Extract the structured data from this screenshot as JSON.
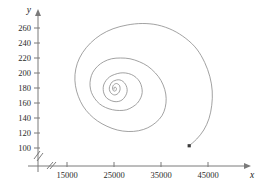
{
  "chart_data": {
    "type": "line",
    "title": "",
    "xlabel": "x",
    "ylabel": "y",
    "grid": false,
    "legend": null,
    "axis_break_x": true,
    "axis_break_y": true,
    "xlim": [
      10000,
      48000
    ],
    "ylim": [
      90,
      272
    ],
    "xticks": [
      15000,
      25000,
      35000,
      45000
    ],
    "xticklabels": [
      "15000",
      "25000",
      "35000",
      "45000"
    ],
    "yticks": [
      100,
      120,
      140,
      160,
      180,
      200,
      220,
      240,
      260
    ],
    "yticklabels": [
      "100",
      "120",
      "140",
      "160",
      "180",
      "200",
      "220",
      "240",
      "260"
    ],
    "equilibrium": {
      "x": 25000,
      "y": 178
    },
    "start_point": {
      "x": 41000,
      "y": 103
    },
    "series": [
      {
        "name": "trajectory",
        "color": "#8a8a8a",
        "marker_at_start": true,
        "points": [
          [
            41000,
            103
          ],
          [
            42600,
            112
          ],
          [
            44100,
            124
          ],
          [
            45200,
            139
          ],
          [
            45800,
            157
          ],
          [
            45900,
            176
          ],
          [
            45400,
            195
          ],
          [
            44300,
            214
          ],
          [
            42600,
            232
          ],
          [
            40300,
            246
          ],
          [
            37500,
            257
          ],
          [
            34300,
            264
          ],
          [
            31000,
            266
          ],
          [
            27800,
            264
          ],
          [
            24800,
            259
          ],
          [
            22200,
            251
          ],
          [
            20000,
            240
          ],
          [
            18300,
            227
          ],
          [
            17200,
            213
          ],
          [
            16700,
            198
          ],
          [
            16800,
            183
          ],
          [
            17400,
            169
          ],
          [
            18400,
            156
          ],
          [
            19800,
            145
          ],
          [
            21500,
            136
          ],
          [
            23500,
            129
          ],
          [
            25700,
            124
          ],
          [
            28000,
            122
          ],
          [
            30200,
            123
          ],
          [
            32200,
            127
          ],
          [
            33900,
            134
          ],
          [
            35200,
            143
          ],
          [
            35900,
            154
          ],
          [
            36100,
            166
          ],
          [
            35800,
            178
          ],
          [
            35000,
            190
          ],
          [
            33800,
            200
          ],
          [
            32200,
            209
          ],
          [
            30400,
            215
          ],
          [
            28400,
            219
          ],
          [
            26400,
            220
          ],
          [
            24500,
            219
          ],
          [
            22800,
            215
          ],
          [
            21500,
            209
          ],
          [
            20500,
            201
          ],
          [
            20000,
            192
          ],
          [
            19900,
            183
          ],
          [
            20200,
            174
          ],
          [
            20900,
            166
          ],
          [
            21900,
            159
          ],
          [
            23200,
            154
          ],
          [
            24700,
            151
          ],
          [
            26200,
            150
          ],
          [
            27700,
            151
          ],
          [
            29000,
            155
          ],
          [
            30000,
            160
          ],
          [
            30700,
            167
          ],
          [
            31000,
            174
          ],
          [
            30900,
            181
          ],
          [
            30500,
            188
          ],
          [
            29700,
            194
          ],
          [
            28700,
            198
          ],
          [
            27500,
            200
          ],
          [
            26300,
            200
          ],
          [
            25100,
            198
          ],
          [
            24100,
            195
          ],
          [
            23300,
            190
          ],
          [
            22800,
            184
          ],
          [
            22700,
            178
          ],
          [
            22900,
            172
          ],
          [
            23400,
            167
          ],
          [
            24100,
            164
          ],
          [
            25000,
            162
          ],
          [
            25900,
            162
          ],
          [
            26700,
            164
          ],
          [
            27300,
            168
          ],
          [
            27700,
            173
          ],
          [
            27800,
            178
          ],
          [
            27600,
            183
          ],
          [
            27200,
            187
          ],
          [
            26600,
            190
          ],
          [
            25900,
            191
          ],
          [
            25200,
            190
          ],
          [
            24600,
            188
          ],
          [
            24200,
            184
          ],
          [
            24000,
            180
          ],
          [
            24100,
            176
          ],
          [
            24400,
            173
          ],
          [
            24900,
            171
          ],
          [
            25400,
            171
          ],
          [
            25900,
            173
          ],
          [
            26200,
            176
          ],
          [
            26300,
            179
          ],
          [
            26200,
            183
          ],
          [
            25900,
            185
          ],
          [
            25500,
            186
          ],
          [
            25100,
            185
          ],
          [
            24800,
            183
          ],
          [
            24700,
            180
          ],
          [
            24800,
            177
          ],
          [
            25000,
            176
          ],
          [
            25300,
            176
          ],
          [
            25500,
            178
          ],
          [
            25500,
            180
          ],
          [
            25300,
            181
          ],
          [
            25100,
            181
          ],
          [
            25000,
            180
          ],
          [
            25000,
            178
          ]
        ]
      }
    ]
  }
}
